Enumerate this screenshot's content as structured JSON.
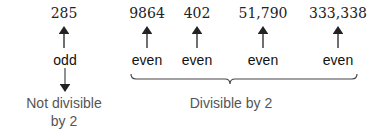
{
  "numbers": [
    {
      "value": "285",
      "parity": "odd",
      "x": 64
    },
    {
      "value": "9864",
      "parity": "even",
      "x": 147
    },
    {
      "value": "402",
      "parity": "even",
      "x": 197
    },
    {
      "value": "51,790",
      "parity": "even",
      "x": 263
    },
    {
      "value": "333,338",
      "parity": "even",
      "x": 338
    }
  ],
  "captions": {
    "not_divisible_line1": "Not divisible",
    "not_divisible_line2": "by 2",
    "divisible": "Divisible by 2"
  },
  "colors": {
    "arrow": "#222222",
    "caption": "#555555"
  }
}
